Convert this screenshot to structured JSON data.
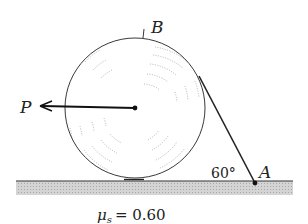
{
  "figure": {
    "labels": {
      "point_b": "B",
      "point_a": "A",
      "force_p": "P",
      "angle": "60°",
      "friction_symbol": "μ",
      "friction_subscript": "s",
      "friction_equals": "= 0.60"
    },
    "colors": {
      "ink": "#222222",
      "ground_fill": "#c8c8c8",
      "hatch": "#9a9a9a"
    }
  }
}
